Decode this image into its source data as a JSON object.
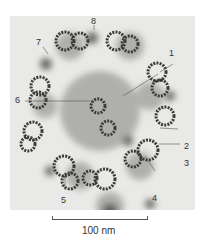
{
  "figure": {
    "labels": [
      {
        "id": "1",
        "text": "1"
      },
      {
        "id": "2",
        "text": "2"
      },
      {
        "id": "3",
        "text": "3"
      },
      {
        "id": "4",
        "text": "4"
      },
      {
        "id": "5",
        "text": "5"
      },
      {
        "id": "6",
        "text": "6"
      },
      {
        "id": "7",
        "text": "7"
      },
      {
        "id": "8",
        "text": "8"
      }
    ],
    "scale_bar": {
      "label": "100 nm"
    }
  },
  "colors": {
    "background": "#e9e9e7",
    "structure_dark": "#3a3a38",
    "structure_mid": "#7a7a78",
    "haze": "#b5b5b2"
  }
}
